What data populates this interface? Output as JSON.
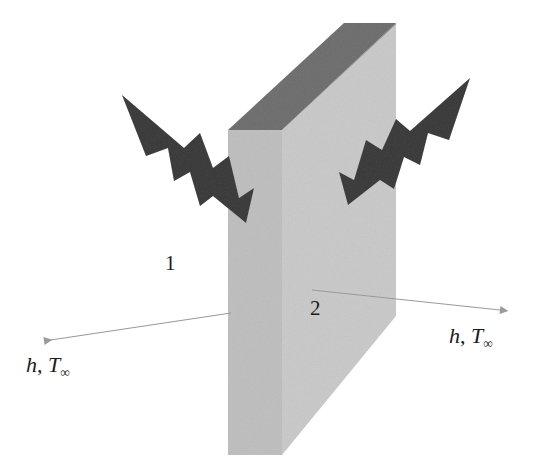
{
  "figure": {
    "type": "heat-transfer-schematic",
    "background_color": "#ffffff"
  },
  "slab": {
    "name": "plane-wall",
    "front_face_color": "#e2e2e2",
    "side_face_color": "#dcdcdc",
    "top_face_color": "#a9a9a9",
    "top_bevel_color": "#b7b7b7"
  },
  "bolts": {
    "color": "#7d7d7d",
    "left_name": "lightning-bolt-left",
    "right_name": "lightning-bolt-right"
  },
  "arrows": {
    "color": "#9a9a9a",
    "left_name": "convection-arrow-left",
    "right_name": "convection-arrow-right"
  },
  "labels": {
    "surface_1": "1",
    "surface_2": "2",
    "convection_left": {
      "h": "h",
      "comma": ",",
      "T": "T",
      "sub": "∞"
    },
    "convection_right": {
      "h": "h",
      "comma": ",",
      "T": "T",
      "sub": "∞"
    }
  }
}
